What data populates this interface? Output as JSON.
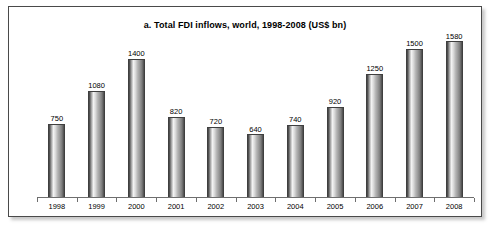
{
  "chart_data": {
    "type": "bar",
    "title": "a. Total FDI inflows, world, 1998-2008 (US$ bn)",
    "xlabel": "",
    "ylabel": "",
    "ylim": [
      0,
      1580
    ],
    "grid": false,
    "legend": null,
    "axis_visible": {
      "x": true,
      "y": false
    },
    "categories": [
      "1998",
      "1999",
      "2000",
      "2001",
      "2002",
      "2003",
      "2004",
      "2005",
      "2006",
      "2007",
      "2008"
    ],
    "values": [
      750,
      1080,
      1400,
      820,
      720,
      640,
      740,
      920,
      1250,
      1500,
      1580
    ],
    "data_labels": [
      "750",
      "1080",
      "1400",
      "820",
      "720",
      "640",
      "740",
      "920",
      "1250",
      "1500",
      "1580"
    ],
    "series": [
      {
        "name": "Total FDI inflows",
        "values": [
          750,
          1080,
          1400,
          820,
          720,
          640,
          740,
          920,
          1250,
          1500,
          1580
        ]
      }
    ],
    "units": "US$ bn"
  },
  "style": {
    "bar_edge_color": "#3f3f3f",
    "bar_fill_light": "#f2f2f2",
    "bar_fill_dark": "#3c3c3c",
    "axis_color": "#6e6e6e",
    "border_color": "#4a4a4a",
    "text_color": "#000000",
    "background": "#ffffff"
  }
}
